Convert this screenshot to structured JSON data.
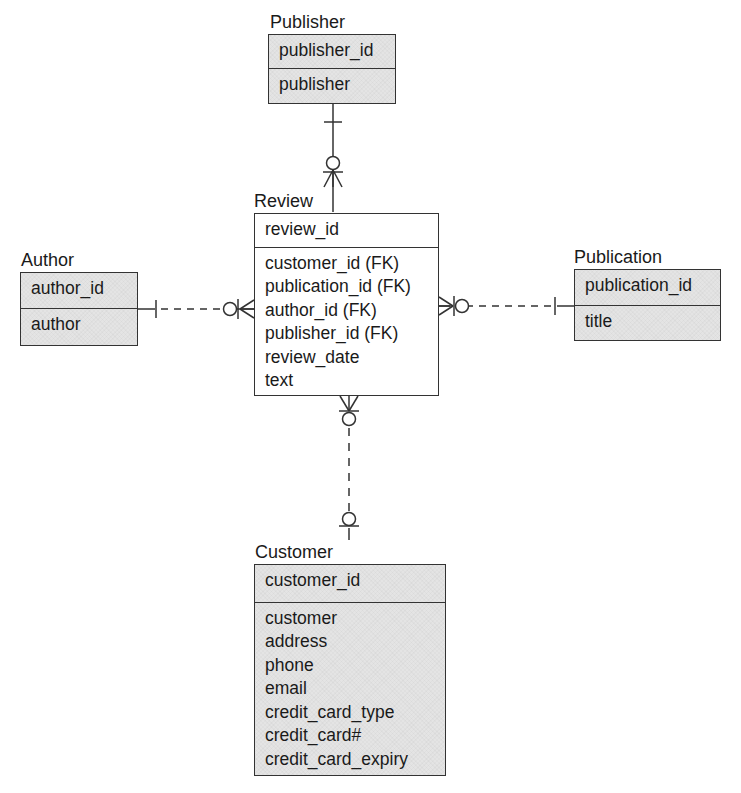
{
  "diagram": {
    "type": "entity-relationship",
    "notation": "crow's foot",
    "colors": {
      "entity_fill": "#e4e4e4",
      "line": "#333333",
      "text": "#1a1a1a"
    }
  },
  "entities": {
    "publisher": {
      "title": "Publisher",
      "primary_key": "publisher_id",
      "attributes": [
        "publisher"
      ],
      "shaded": true
    },
    "review": {
      "title": "Review",
      "primary_key": "review_id",
      "attributes": [
        "customer_id (FK)",
        "publication_id (FK)",
        "author_id (FK)",
        "publisher_id (FK)",
        "review_date",
        "text"
      ],
      "shaded": false
    },
    "author": {
      "title": "Author",
      "primary_key": "author_id",
      "attributes": [
        "author"
      ],
      "shaded": true
    },
    "publication": {
      "title": "Publication",
      "primary_key": "publication_id",
      "attributes": [
        "title"
      ],
      "shaded": true
    },
    "customer": {
      "title": "Customer",
      "primary_key": "customer_id",
      "attributes": [
        "customer",
        "address",
        "phone",
        "email",
        "credit_card_type",
        "credit_card#",
        "credit_card_expiry"
      ],
      "shaded": true
    }
  },
  "relationships": [
    {
      "from": "Publisher",
      "to": "Review",
      "from_cardinality": "exactly one",
      "to_cardinality": "zero or many",
      "line": "solid"
    },
    {
      "from": "Author",
      "to": "Review",
      "from_cardinality": "exactly one",
      "to_cardinality": "zero or many",
      "line": "dashed"
    },
    {
      "from": "Publication",
      "to": "Review",
      "from_cardinality": "exactly one",
      "to_cardinality": "zero or many",
      "line": "dashed"
    },
    {
      "from": "Customer",
      "to": "Review",
      "from_cardinality": "zero or one",
      "to_cardinality": "zero or many",
      "line": "dashed"
    }
  ]
}
